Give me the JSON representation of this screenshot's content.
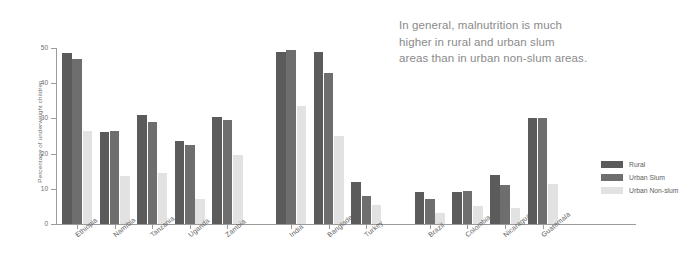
{
  "annotation": {
    "lines": [
      "In general, malnutrition is much",
      "higher in rural and urban slum",
      "areas than in urban non-slum areas."
    ]
  },
  "legend": {
    "items": [
      {
        "label": "Rural",
        "color": "#5b5b5b"
      },
      {
        "label": "Urban Slum",
        "color": "#6e6e6e"
      },
      {
        "label": "Urban Non-slum",
        "color": "#e2e2e2"
      }
    ]
  },
  "chart_data": {
    "type": "bar",
    "title": "",
    "xlabel": "",
    "ylabel": "Percentage of underweight children",
    "ylim": [
      0,
      50
    ],
    "yticks": [
      0,
      10,
      20,
      30,
      40,
      50
    ],
    "grid": false,
    "legend_position": "right",
    "categories": [
      "Ethiopia",
      "Namibia",
      "Tanzania",
      "Uganda",
      "Zambia",
      "India",
      "Bangladesh",
      "Turkey",
      "Brazil",
      "Colombia",
      "Nicaragua",
      "Guatemala"
    ],
    "groups": [
      {
        "name": "Africa",
        "categories": [
          "Ethiopia",
          "Namibia",
          "Tanzania",
          "Uganda",
          "Zambia"
        ]
      },
      {
        "name": "Asia",
        "categories": [
          "India",
          "Bangladesh",
          "Turkey"
        ]
      },
      {
        "name": "Latin America",
        "categories": [
          "Brazil",
          "Colombia",
          "Nicaragua",
          "Guatemala"
        ]
      }
    ],
    "series": [
      {
        "name": "Rural",
        "color": "#5b5b5b",
        "values": [
          48.5,
          26,
          31,
          23.5,
          30.5,
          49,
          49,
          12,
          9,
          9,
          14,
          30
        ]
      },
      {
        "name": "Urban Slum",
        "color": "#6e6e6e",
        "values": [
          47,
          26.5,
          29,
          22.5,
          29.5,
          49.5,
          43,
          8,
          7,
          9.5,
          11,
          30
        ]
      },
      {
        "name": "Urban Non-slum",
        "color": "#e2e2e2",
        "values": [
          26.5,
          13.5,
          14.5,
          7,
          19.5,
          33.5,
          25,
          5.5,
          3,
          5,
          4.5,
          11.5
        ]
      }
    ]
  }
}
